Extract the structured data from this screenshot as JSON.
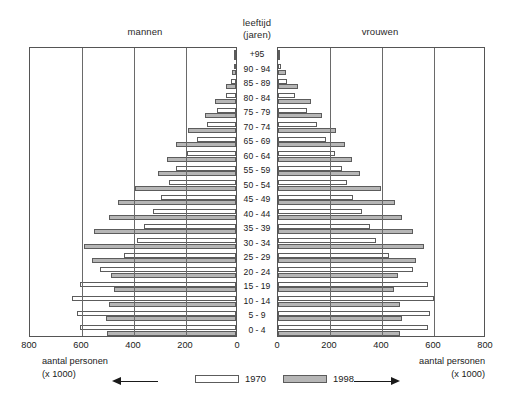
{
  "headers": {
    "men": "mannen",
    "women": "vrouwen",
    "age_line1": "leeftijd",
    "age_line2": "(jaren)"
  },
  "footer": {
    "left_line1": "aantal personen",
    "left_line2": "(x 1000)",
    "right_line1": "aantal personen",
    "right_line2": "(x 1000)",
    "arrow_left": "arrow-left-icon",
    "arrow_right": "arrow-right-icon"
  },
  "legend": {
    "items": [
      {
        "label": "1970",
        "color": "#ffffff"
      },
      {
        "label": "1998",
        "color": "#b6b6b6"
      }
    ]
  },
  "axis": {
    "ticks_left": [
      "800",
      "600",
      "400",
      "200",
      "0"
    ],
    "ticks_right": [
      "0",
      "200",
      "400",
      "600",
      "800"
    ],
    "max": 800,
    "gridlines": [
      200,
      400,
      600
    ]
  },
  "chart_data": {
    "type": "bar",
    "subtype": "population-pyramid",
    "title": "",
    "xlabel": "aantal personen (x 1000)",
    "ylabel": "leeftijd (jaren)",
    "xlim": [
      0,
      800
    ],
    "grid": true,
    "legend_position": "bottom-center",
    "orientation": "horizontal-diverging",
    "categories": [
      "+95",
      "90 - 94",
      "85 - 89",
      "80 - 84",
      "75 - 79",
      "70 - 74",
      "65 - 69",
      "60 - 64",
      "55 - 59",
      "50 - 54",
      "45 - 49",
      "40 - 44",
      "35 - 39",
      "30 - 34",
      "25 - 29",
      "20 - 24",
      "15 - 19",
      "10 - 14",
      "5 - 9",
      "0 - 4"
    ],
    "series": [
      {
        "name": "1970",
        "side": "mannen",
        "color": "#ffffff",
        "values": [
          1,
          6,
          18,
          40,
          73,
          112,
          150,
          190,
          230,
          258,
          288,
          320,
          352,
          380,
          430,
          525,
          600,
          630,
          610,
          600
        ]
      },
      {
        "name": "1998",
        "side": "mannen",
        "color": "#b6b6b6",
        "values": [
          3,
          14,
          40,
          80,
          120,
          185,
          230,
          265,
          300,
          390,
          455,
          490,
          545,
          585,
          555,
          480,
          470,
          490,
          500,
          495
        ]
      },
      {
        "name": "1970",
        "side": "vrouwen",
        "color": "#ffffff",
        "values": [
          2,
          12,
          34,
          66,
          110,
          150,
          185,
          218,
          245,
          265,
          290,
          322,
          352,
          378,
          425,
          520,
          578,
          600,
          585,
          575
        ]
      },
      {
        "name": "1998",
        "side": "vrouwen",
        "color": "#b6b6b6",
        "values": [
          9,
          32,
          78,
          125,
          168,
          222,
          258,
          285,
          315,
          398,
          450,
          478,
          520,
          560,
          530,
          460,
          448,
          470,
          478,
          470
        ]
      }
    ]
  }
}
